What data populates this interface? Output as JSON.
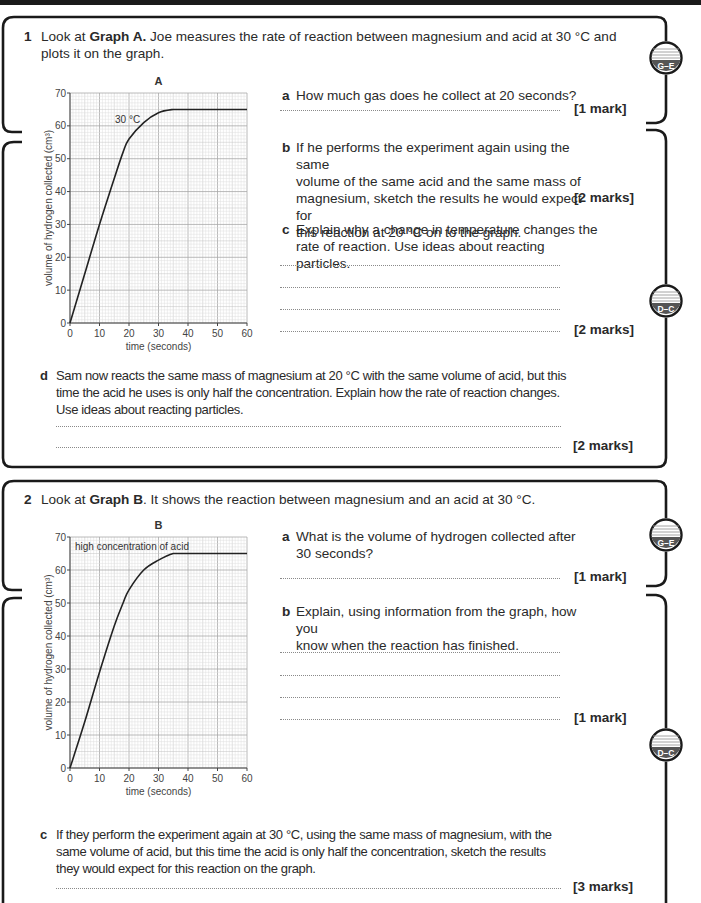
{
  "header_bar": {
    "color": "#1a1a1a"
  },
  "question1": {
    "number": "1",
    "intro_pre": "Look at ",
    "intro_bold": "Graph A.",
    "intro_post_line1": " Joe measures the rate of reaction between magnesium and acid at 30 °C and",
    "intro_line2": "plots it on the graph.",
    "parts": {
      "a": {
        "letter": "a",
        "text": "How much gas does he collect at 20 seconds?",
        "marks": "[1 mark]"
      },
      "b": {
        "letter": "b",
        "lines": [
          "If he performs the experiment again using the same",
          "volume of the same acid and the same mass of",
          "magnesium, sketch the results he would expect for",
          "this reaction at 20 °C on to the graph."
        ],
        "marks": "[2 marks]"
      },
      "c": {
        "letter": "c",
        "lines": [
          "Explain why a change in temperature changes the",
          "rate of reaction. Use ideas about reacting particles."
        ],
        "marks": "[2 marks]"
      },
      "d": {
        "letter": "d",
        "lines": [
          "Sam now reacts the same mass of magnesium at 20 °C with the same volume of acid, but this",
          "time the acid he uses is only half the concentration. Explain how the rate of reaction changes.",
          "Use ideas about reacting particles."
        ],
        "marks": "[2 marks]"
      }
    }
  },
  "question2": {
    "number": "2",
    "intro_pre": "Look at ",
    "intro_bold": "Graph B",
    "intro_post": ". It shows the reaction between magnesium and an acid at 30 °C.",
    "parts": {
      "a": {
        "letter": "a",
        "lines": [
          "What is the volume of hydrogen collected after",
          "30 seconds?"
        ],
        "marks": "[1 mark]"
      },
      "b": {
        "letter": "b",
        "lines": [
          "Explain, using information from the graph, how you",
          "know when the reaction has finished."
        ],
        "marks": "[1 mark]"
      },
      "c": {
        "letter": "c",
        "lines": [
          "If they perform the experiment again at 30 °C, using the same mass of magnesium, with the",
          "same volume of acid, but this time the acid is only half the concentration, sketch the results",
          "they would expect for this reaction on the graph."
        ],
        "marks": "[3 marks]"
      }
    }
  },
  "grade_badges": [
    {
      "label": "G–E",
      "position": "q1-top"
    },
    {
      "label": "D–C",
      "position": "q1-middle"
    },
    {
      "label": "G–E",
      "position": "q2-top"
    },
    {
      "label": "D–C",
      "position": "q2-middle"
    }
  ],
  "chart_data": [
    {
      "type": "line",
      "title": "A",
      "xlabel": "time (seconds)",
      "ylabel": "volume of hydrogen collected (cm³)",
      "xlim": [
        0,
        60
      ],
      "ylim": [
        0,
        70
      ],
      "xticks": [
        0,
        10,
        20,
        30,
        40,
        50,
        60
      ],
      "yticks": [
        0,
        10,
        20,
        30,
        40,
        50,
        60,
        70
      ],
      "grid": true,
      "annotation": "30 °C",
      "series": [
        {
          "name": "30 °C",
          "x": [
            0,
            5,
            10,
            15,
            18,
            20,
            25,
            30,
            35,
            38,
            40,
            50,
            60
          ],
          "y": [
            0,
            15,
            30,
            44,
            52,
            56,
            61,
            64,
            65,
            65,
            65,
            65,
            65
          ]
        }
      ]
    },
    {
      "type": "line",
      "title": "B",
      "xlabel": "time (seconds)",
      "ylabel": "volume of hydrogen collected (cm³)",
      "xlim": [
        0,
        60
      ],
      "ylim": [
        0,
        70
      ],
      "xticks": [
        0,
        10,
        20,
        30,
        40,
        50,
        60
      ],
      "yticks": [
        0,
        10,
        20,
        30,
        40,
        50,
        60,
        70
      ],
      "grid": true,
      "annotation": "high concentration of acid",
      "series": [
        {
          "name": "high concentration of acid",
          "x": [
            0,
            5,
            10,
            15,
            18,
            20,
            25,
            30,
            35,
            38,
            40,
            50,
            60
          ],
          "y": [
            0,
            14,
            29,
            43,
            50,
            54,
            60,
            63,
            65,
            65,
            65,
            65,
            65
          ]
        }
      ]
    }
  ]
}
